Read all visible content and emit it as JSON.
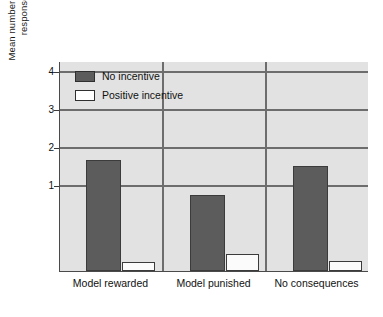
{
  "chart_data": {
    "type": "bar",
    "title": "",
    "subtitle": "",
    "xlabel": "",
    "ylabel": "Mean number of different imitative responses reproduced",
    "ylabel_lines": [
      "Mean number of different imitative",
      "responses reproduced"
    ],
    "categories": [
      "Model rewarded",
      "Model punished",
      "No consequences"
    ],
    "series": [
      {
        "name": "No incentive",
        "color": "#5c5c5c",
        "values": [
          2.7,
          1.8,
          2.55
        ]
      },
      {
        "name": "Positive incentive",
        "color": "#ffffff",
        "values": [
          3.45,
          3.67,
          3.48
        ]
      }
    ],
    "ylim": [
      0,
      4.35
    ],
    "yticks": [
      1,
      2,
      3,
      4
    ],
    "ytick_labels": [
      "1",
      "2",
      "3",
      "4"
    ],
    "grid": "horizontal",
    "legend_position": "top-left",
    "plot_background": "#e2e2e2",
    "grid_color": "#6d6d6d",
    "axis_color": "#4a4a4a"
  },
  "legend": {
    "items": [
      {
        "label": "No incentive",
        "swatch": "dark"
      },
      {
        "label": "Positive incentive",
        "swatch": "light"
      }
    ]
  }
}
